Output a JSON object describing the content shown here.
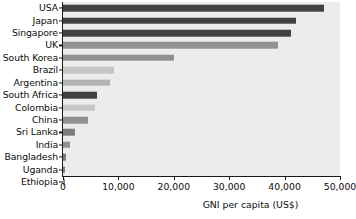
{
  "chart_data": {
    "type": "bar",
    "orientation": "horizontal",
    "title": "",
    "subtitle": "",
    "xlabel": "GNI per capita (US$)",
    "ylabel": "",
    "xlim": [
      0,
      50000
    ],
    "xticks": [
      0,
      10000,
      20000,
      30000,
      40000,
      50000
    ],
    "xtick_labels": [
      "0",
      "10,000",
      "20,000",
      "30,000",
      "40,000",
      "50,000"
    ],
    "grid": false,
    "legend": "none",
    "plot_background": "#ececec",
    "categories": [
      "USA",
      "Japan",
      "Singapore",
      "UK",
      "South Korea",
      "Brazil",
      "Argentina",
      "South Africa",
      "Colombia",
      "China",
      "Sri Lanka",
      "India",
      "Bangladesh",
      "Uganda",
      "Ethiopia"
    ],
    "values": [
      47200,
      42100,
      41200,
      38800,
      20100,
      9200,
      8400,
      6200,
      5700,
      4500,
      2200,
      1200,
      600,
      450,
      300
    ],
    "bar_colors": [
      "#414141",
      "#414141",
      "#414141",
      "#919191",
      "#919191",
      "#c6c6c6",
      "#b3b3b3",
      "#414141",
      "#c6c6c6",
      "#919191",
      "#7d7d7d",
      "#919191",
      "#7d7d7d",
      "#7d7d7d",
      "#919191"
    ]
  }
}
